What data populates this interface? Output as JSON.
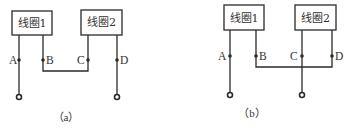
{
  "diagrams": [
    {
      "id": "a",
      "caption": "（a）",
      "coil1_label": "线圈1",
      "coil2_label": "线圈2",
      "terminals": [
        "A",
        "B",
        "C",
        "D"
      ],
      "connection": "B connected to C; A and D are external leads"
    },
    {
      "id": "b",
      "caption": "（b）",
      "coil1_label": "线圈1",
      "coil2_label": "线圈2",
      "terminals": [
        "A",
        "B",
        "C",
        "D"
      ],
      "connection": "B connected to D; A and C are external leads"
    }
  ]
}
